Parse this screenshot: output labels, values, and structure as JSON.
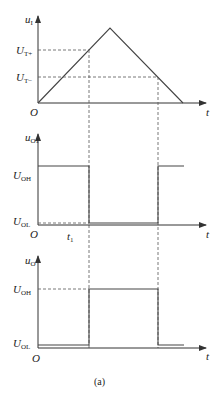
{
  "figure": {
    "caption": "(a)",
    "panels": [
      {
        "id": "input",
        "y_label": "u",
        "y_sub": "I",
        "x_label": "t",
        "origin_label": "O",
        "levels": [
          {
            "label": "U",
            "sub": "T+"
          },
          {
            "label": "U",
            "sub": "T−"
          }
        ],
        "waveform": "triangle"
      },
      {
        "id": "comparator",
        "y_label": "u",
        "y_sub": "O1",
        "x_label": "t",
        "origin_label": "O",
        "time_marker": {
          "label": "t",
          "sub": "1"
        },
        "levels": [
          {
            "label": "U",
            "sub": "OH"
          },
          {
            "label": "U",
            "sub": "OL"
          }
        ],
        "waveform": "square-high-low-high"
      },
      {
        "id": "output",
        "y_label": "u",
        "y_sub": "O",
        "x_label": "t",
        "origin_label": "O",
        "levels": [
          {
            "label": "U",
            "sub": "OH"
          },
          {
            "label": "U",
            "sub": "OL"
          }
        ],
        "waveform": "square-low-high-low"
      }
    ]
  }
}
